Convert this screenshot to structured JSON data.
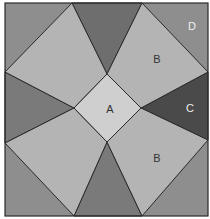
{
  "diagram": {
    "type": "quilt-block",
    "labels": {
      "center": "A",
      "kite_top_right": "B",
      "kite_bottom_right": "B",
      "triangle_right": "C",
      "corner_top_right": "D"
    },
    "colors": {
      "background": "#ffffff",
      "border": "#2a2a2a",
      "piece_a": "#cfcfcf",
      "piece_b": "#b4b4b4",
      "piece_c": "#4a4a4a",
      "piece_d": "#8e8e8e",
      "side_triangle": "#6e6e6e",
      "label_dark": "#333333",
      "label_light": "#eeeeee"
    }
  }
}
